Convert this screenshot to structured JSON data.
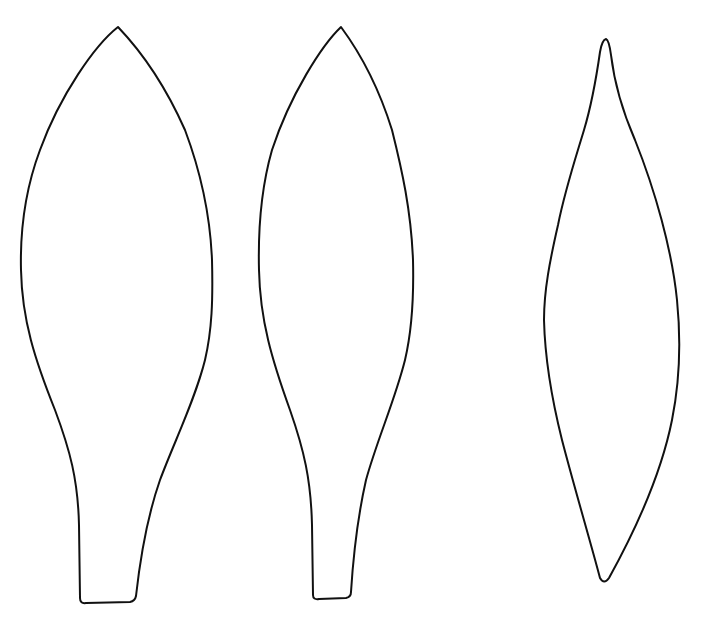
{
  "canvas": {
    "width": 711,
    "height": 618,
    "background": "#ffffff"
  },
  "style": {
    "stroke_color": "#111111"
  },
  "shapes": [
    {
      "name": "leaf-petal-left",
      "type": "leaf-outline-with-stem"
    },
    {
      "name": "leaf-petal-middle",
      "type": "leaf-outline-with-stem"
    },
    {
      "name": "leaf-petal-right",
      "type": "lanceolate-outline"
    }
  ]
}
